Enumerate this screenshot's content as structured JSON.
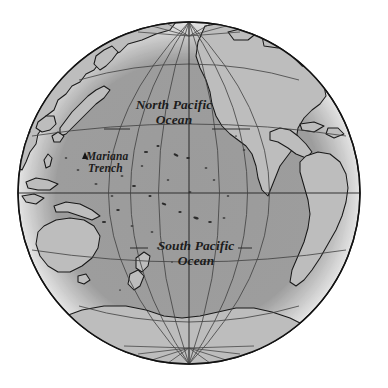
{
  "figure": {
    "kind": "orthographic-globe-map",
    "projection": "orthographic",
    "region": "Pacific Ocean hemisphere",
    "background_color": "#ffffff",
    "ocean_color": "#9e9e9e",
    "land_color": "#bcbcbc",
    "limb_color": "#dcdcdc",
    "outline_color": "#1a1a1a",
    "graticule_color": "#3a3a3a",
    "text_color": "#1c1c1c"
  },
  "labels": {
    "north_pacific": {
      "line1": "North Pacific",
      "line2": "Ocean"
    },
    "south_pacific": {
      "line1": "South Pacific",
      "line2": "Ocean"
    },
    "mariana_trench": {
      "line1": "Mariana",
      "line2": "Trench",
      "marker": "triangle-marker"
    }
  },
  "graticule": {
    "latitude_interval_degrees": 30,
    "longitude_interval_degrees": 30,
    "equator_shown": true,
    "poles_shown": [
      "north-pole",
      "south-pole"
    ]
  },
  "features": {
    "oceans": [
      "North Pacific Ocean",
      "South Pacific Ocean"
    ],
    "landmasses": [
      "Asia",
      "Japan",
      "Australia",
      "New Zealand",
      "New Guinea",
      "North America",
      "Central America",
      "South America",
      "Antarctica"
    ],
    "annotated_point": "Mariana Trench"
  }
}
